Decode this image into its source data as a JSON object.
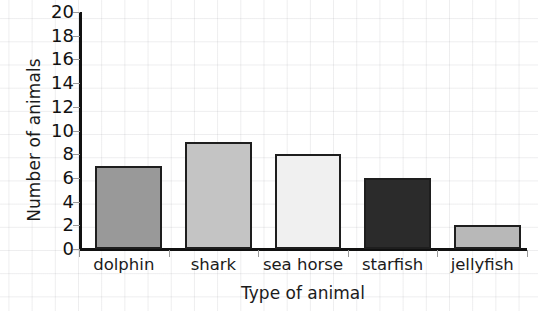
{
  "chart_data": {
    "type": "bar",
    "title": "",
    "subtitle": "",
    "xlabel": "Type of animal",
    "ylabel": "Number of animals",
    "categories": [
      "dolphin",
      "shark",
      "sea horse",
      "starfish",
      "jellyfish"
    ],
    "values": [
      7,
      9,
      8,
      6,
      2
    ],
    "ylim": [
      0,
      20
    ],
    "ytick_step": 2,
    "ytick_labels": [
      "0",
      "2",
      "4",
      "6",
      "8",
      "10",
      "12",
      "14",
      "16",
      "18",
      "20"
    ],
    "grid": true,
    "grid_style": "faint graph-paper grid behind plot",
    "legend": false,
    "legend_position": "none",
    "bar_colors": [
      "#999999",
      "#c4c4c4",
      "#f0f0f0",
      "#2b2b2b",
      "#b8b8b8"
    ],
    "bar_outline_color": "#1e1e1e",
    "axis_color": "#111111",
    "background_color": "#ffffff",
    "gridline_color": "#c8c8cd",
    "text_color": "#1b1b1b"
  }
}
